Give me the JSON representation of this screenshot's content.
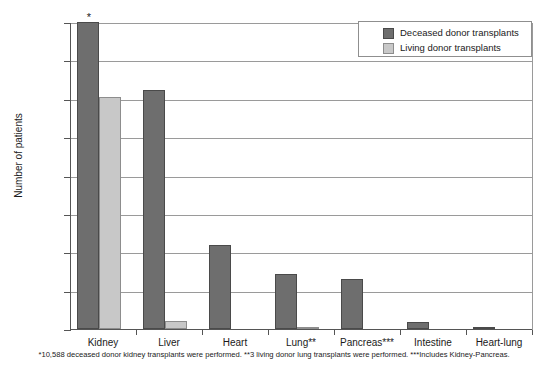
{
  "chart_data": {
    "type": "bar",
    "title": "",
    "xlabel": "",
    "ylabel": "Number of patients",
    "ylim": [
      0,
      8000
    ],
    "ytick_values": [
      0,
      1000,
      2000,
      3000,
      4000,
      5000,
      6000,
      7000,
      8000
    ],
    "ytick_labels": [
      "0",
      "1000",
      "2000",
      "3000",
      "4000",
      "5000",
      "6000",
      "7000",
      ">8000"
    ],
    "grid": true,
    "legend_position": "top-right",
    "categories": [
      "Kidney",
      "Liver",
      "Heart",
      "Lung**",
      "Pancreas***",
      "Intestine",
      "Heart-lung"
    ],
    "series": [
      {
        "name": "Deceased donor transplants",
        "color": "#6e6e6e",
        "values": [
          8000,
          6220,
          2200,
          1430,
          1300,
          175,
          35
        ],
        "value_notes": [
          "truncated at >8000; actual 10,588",
          "",
          "",
          "",
          "",
          "",
          ""
        ]
      },
      {
        "name": "Living donor transplants",
        "color": "#c8c8c8",
        "values": [
          6050,
          215,
          0,
          3,
          0,
          0,
          0
        ],
        "value_notes": [
          "",
          "",
          "",
          "3 living donor lung transplants",
          "",
          "",
          ""
        ]
      }
    ],
    "annotations": [
      {
        "text": "*",
        "attached_to": "Kidney deceased donor transplants"
      }
    ],
    "footnote": "*10,588 deceased donor kidney transplants were performed.  **3 living donor lung transplants were performed.  ***Includes Kidney-Pancreas."
  }
}
